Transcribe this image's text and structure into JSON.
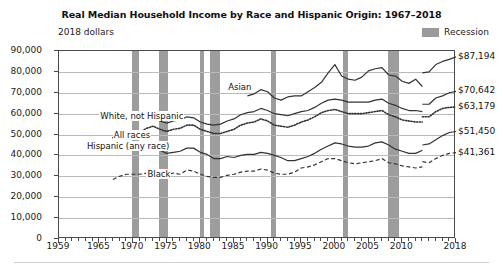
{
  "chart_data": {
    "type": "line",
    "title": "Real Median Household Income by Race and Hispanic Origin: 1967–2018",
    "unit_note": "2018 dollars",
    "xlabel": "",
    "ylabel": "2018 dollars",
    "xlim": [
      1959,
      2018
    ],
    "ylim": [
      0,
      90000
    ],
    "grid": true,
    "legend_position": "top-right",
    "legend": [
      {
        "label": "Recession",
        "color": "#9d9d9d",
        "type": "band"
      }
    ],
    "ytick_labels": [
      "0",
      "10,000",
      "20,000",
      "30,000",
      "40,000",
      "50,000",
      "60,000",
      "70,000",
      "80,000",
      "90,000"
    ],
    "ytick_values": [
      0,
      10000,
      20000,
      30000,
      40000,
      50000,
      60000,
      70000,
      80000,
      90000
    ],
    "xtick_labels": [
      "1959",
      "1965",
      "1970",
      "1975",
      "1980",
      "1985",
      "1990",
      "1995",
      "2000",
      "2005",
      "2010",
      "2018"
    ],
    "xtick_values": [
      1959,
      1965,
      1970,
      1975,
      1980,
      1985,
      1990,
      1995,
      2000,
      2005,
      2010,
      2018
    ],
    "recessions": [
      {
        "start": 1969.9,
        "end": 1970.9
      },
      {
        "start": 1973.9,
        "end": 1975.2
      },
      {
        "start": 1980.0,
        "end": 1980.6
      },
      {
        "start": 1981.5,
        "end": 1982.9
      },
      {
        "start": 1990.5,
        "end": 1991.2
      },
      {
        "start": 2001.2,
        "end": 2001.9
      },
      {
        "start": 2007.9,
        "end": 2009.5
      }
    ],
    "end_labels": [
      {
        "series": "Asian",
        "value": 87194,
        "text": "$87,194"
      },
      {
        "series": "White, not Hispanic",
        "value": 70642,
        "text": "$70,642"
      },
      {
        "series": "All races",
        "value": 63179,
        "text": "$63,179"
      },
      {
        "series": "Hispanic (any race)",
        "value": 51450,
        "text": "$51,450"
      },
      {
        "series": "Black",
        "value": 41361,
        "text": "$41,361"
      }
    ],
    "annotations": [
      {
        "text": "Asian",
        "x": 1984,
        "y": 72500
      },
      {
        "text": "White, not Hispanic",
        "x": 1965,
        "y": 58500
      },
      {
        "text": "All races",
        "x": 1967,
        "y": 49500
      },
      {
        "text": "Hispanic (any race)",
        "x": 1963,
        "y": 44000
      },
      {
        "text": "Black",
        "x": 1972,
        "y": 30500
      }
    ],
    "note_break_year": 2013,
    "series": [
      {
        "name": "Asian",
        "style": "solid",
        "color": "#333333",
        "x": [
          1987,
          1988,
          1989,
          1990,
          1991,
          1992,
          1993,
          1994,
          1995,
          1996,
          1997,
          1998,
          1999,
          2000,
          2001,
          2002,
          2003,
          2004,
          2005,
          2006,
          2007,
          2008,
          2009,
          2010,
          2011,
          2012,
          2013
        ],
        "values": [
          68500,
          69500,
          71500,
          70500,
          67500,
          66500,
          68000,
          68500,
          68500,
          70500,
          72500,
          75000,
          79500,
          83500,
          78000,
          76500,
          76000,
          77500,
          80500,
          81500,
          82000,
          78500,
          78000,
          75500,
          74500,
          76500,
          73000
        ]
      },
      {
        "name": "Asian",
        "style": "solid-break",
        "color": "#333333",
        "x": [
          2013,
          2014,
          2015,
          2016,
          2017,
          2018
        ],
        "values": [
          79500,
          80000,
          83500,
          85000,
          86000,
          87194
        ]
      },
      {
        "name": "White, not Hispanic",
        "style": "solid",
        "color": "#333333",
        "x": [
          1972,
          1973,
          1974,
          1975,
          1976,
          1977,
          1978,
          1979,
          1980,
          1981,
          1982,
          1983,
          1984,
          1985,
          1986,
          1987,
          1988,
          1989,
          1990,
          1991,
          1992,
          1993,
          1994,
          1995,
          1996,
          1997,
          1998,
          1999,
          2000,
          2001,
          2002,
          2003,
          2004,
          2005,
          2006,
          2007,
          2008,
          2009,
          2010,
          2011,
          2012,
          2013
        ],
        "values": [
          57500,
          58000,
          56500,
          55500,
          56500,
          57000,
          58500,
          58000,
          56000,
          55000,
          54500,
          55000,
          56500,
          57500,
          59500,
          60500,
          61000,
          62500,
          61500,
          60000,
          59500,
          59000,
          60000,
          61000,
          61500,
          63000,
          65000,
          66500,
          67000,
          66500,
          65500,
          65500,
          65500,
          65500,
          66500,
          67000,
          65000,
          64000,
          62500,
          61500,
          61500,
          61000
        ]
      },
      {
        "name": "White, not Hispanic",
        "style": "solid-break",
        "color": "#333333",
        "x": [
          2013,
          2014,
          2015,
          2016,
          2017,
          2018
        ],
        "values": [
          64500,
          64500,
          67500,
          68500,
          70000,
          70642
        ]
      },
      {
        "name": "All races",
        "style": "dotted",
        "color": "#333333",
        "x": [
          1967,
          1968,
          1969,
          1970,
          1971,
          1972,
          1973,
          1974,
          1975,
          1976,
          1977,
          1978,
          1979,
          1980,
          1981,
          1982,
          1983,
          1984,
          1985,
          1986,
          1987,
          1988,
          1989,
          1990,
          1991,
          1992,
          1993,
          1994,
          1995,
          1996,
          1997,
          1998,
          1999,
          2000,
          2001,
          2002,
          2003,
          2004,
          2005,
          2006,
          2007,
          2008,
          2009,
          2010,
          2011,
          2012,
          2013
        ],
        "values": [
          48500,
          50000,
          51500,
          51000,
          51000,
          53000,
          54000,
          52500,
          51500,
          52500,
          53000,
          54500,
          54500,
          52500,
          51500,
          50500,
          50500,
          51500,
          52500,
          54500,
          55500,
          56000,
          57500,
          56500,
          54500,
          54000,
          53500,
          54500,
          56000,
          57000,
          58500,
          60500,
          61500,
          62000,
          61000,
          60000,
          60000,
          60000,
          60500,
          61000,
          61500,
          59500,
          58500,
          57000,
          56500,
          56000,
          56000
        ]
      },
      {
        "name": "All races",
        "style": "dotted-break",
        "color": "#333333",
        "x": [
          2013,
          2014,
          2015,
          2016,
          2017,
          2018
        ],
        "values": [
          58500,
          58500,
          61000,
          62500,
          63000,
          63179
        ]
      },
      {
        "name": "Hispanic (any race)",
        "style": "solid",
        "color": "#333333",
        "x": [
          1972,
          1973,
          1974,
          1975,
          1976,
          1977,
          1978,
          1979,
          1980,
          1981,
          1982,
          1983,
          1984,
          1985,
          1986,
          1987,
          1988,
          1989,
          1990,
          1991,
          1992,
          1993,
          1994,
          1995,
          1996,
          1997,
          1998,
          1999,
          2000,
          2001,
          2002,
          2003,
          2004,
          2005,
          2006,
          2007,
          2008,
          2009,
          2010,
          2011,
          2012,
          2013
        ],
        "values": [
          43500,
          43500,
          42500,
          41000,
          41500,
          42000,
          43500,
          43500,
          41500,
          40500,
          38500,
          38500,
          39500,
          39000,
          40000,
          40500,
          40500,
          41500,
          41000,
          40000,
          39000,
          37500,
          37500,
          38500,
          39500,
          41000,
          43000,
          44500,
          46000,
          45500,
          44500,
          44000,
          44000,
          44500,
          46000,
          46500,
          45000,
          43000,
          42000,
          41000,
          41000,
          42500
        ]
      },
      {
        "name": "Hispanic (any race)",
        "style": "solid-break",
        "color": "#333333",
        "x": [
          2013,
          2014,
          2015,
          2016,
          2017,
          2018
        ],
        "values": [
          45000,
          45500,
          47500,
          49500,
          51000,
          51450
        ]
      },
      {
        "name": "Black",
        "style": "dashed",
        "color": "#333333",
        "x": [
          1967,
          1968,
          1969,
          1970,
          1971,
          1972,
          1973,
          1974,
          1975,
          1976,
          1977,
          1978,
          1979,
          1980,
          1981,
          1982,
          1983,
          1984,
          1985,
          1986,
          1987,
          1988,
          1989,
          1990,
          1991,
          1992,
          1993,
          1994,
          1995,
          1996,
          1997,
          1998,
          1999,
          2000,
          2001,
          2002,
          2003,
          2004,
          2005,
          2006,
          2007,
          2008,
          2009,
          2010,
          2011,
          2012,
          2013
        ],
        "values": [
          28500,
          30000,
          31000,
          31000,
          31000,
          31500,
          32000,
          31500,
          31000,
          31500,
          31000,
          33000,
          32500,
          31000,
          30000,
          29500,
          29500,
          30500,
          31000,
          32000,
          32500,
          32500,
          33500,
          33000,
          31500,
          31000,
          31000,
          32000,
          34000,
          34500,
          35500,
          37000,
          38500,
          38500,
          37500,
          36500,
          36000,
          36500,
          37000,
          37500,
          38500,
          36500,
          36000,
          35000,
          34500,
          34000,
          34500
        ]
      },
      {
        "name": "Black",
        "style": "dashed-break",
        "color": "#333333",
        "x": [
          2013,
          2014,
          2015,
          2016,
          2017,
          2018
        ],
        "values": [
          37000,
          36500,
          38500,
          40000,
          41000,
          41361
        ]
      }
    ]
  }
}
